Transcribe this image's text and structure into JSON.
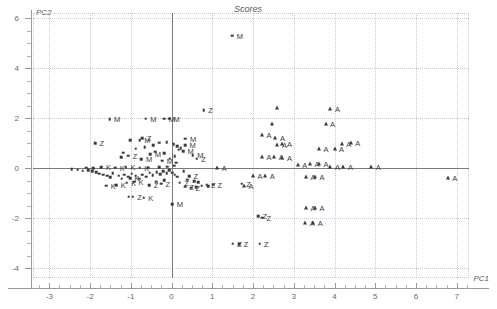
{
  "chart_data": {
    "type": "scatter",
    "title": "Scores",
    "xlabel": "PC1",
    "ylabel": "PC2",
    "xlim": [
      -3.4,
      7.3
    ],
    "ylim": [
      -4.4,
      6.2
    ],
    "xticks": [
      -3,
      -2,
      -1,
      0,
      1,
      2,
      3,
      4,
      5,
      6,
      7
    ],
    "xticklabels": [
      "-3",
      "-2",
      "-1",
      "0",
      "1",
      "2",
      "3",
      "4",
      "5",
      "6",
      "7"
    ],
    "yticks": [
      -4,
      -2,
      0,
      2,
      4,
      6
    ],
    "yticklabels": [
      "-4",
      "-2",
      "0",
      "2",
      "4",
      "6"
    ],
    "xminorstep": 0.25,
    "yminorstep": 0.5,
    "grid": "dotted",
    "grid_x": [
      -3,
      -2,
      -1,
      0,
      1,
      2,
      3,
      4,
      5,
      6,
      7
    ],
    "grid_y": [
      -4,
      -2,
      0,
      2,
      4,
      6
    ],
    "legend": "none",
    "marker_color": "#3a3a3a",
    "axis_color": "#9a9a9a",
    "grid_color": "#c8c8d8",
    "series": [
      {
        "name": "M",
        "marker": "square",
        "label": "M",
        "points": [
          {
            "x": 1.49,
            "y": 5.3,
            "label": "M"
          },
          {
            "x": -1.52,
            "y": 1.95,
            "label": "M"
          },
          {
            "x": -0.63,
            "y": 1.98,
            "label": "M"
          },
          {
            "x": -0.18,
            "y": 1.97,
            "label": "M"
          },
          {
            "x": -0.06,
            "y": 1.97,
            "label": "M"
          },
          {
            "x": -0.78,
            "y": 1.12,
            "label": "M"
          },
          {
            "x": 0.34,
            "y": 1.18,
            "label": "M"
          },
          {
            "x": 0.33,
            "y": 0.92,
            "label": "M"
          },
          {
            "x": 0.28,
            "y": 0.68,
            "label": "M"
          },
          {
            "x": 0.52,
            "y": 0.52,
            "label": "M"
          },
          {
            "x": -0.52,
            "y": 0.56,
            "label": "M"
          },
          {
            "x": -0.74,
            "y": 0.36,
            "label": "M"
          },
          {
            "x": -0.23,
            "y": 0.3,
            "label": "M"
          },
          {
            "x": 0.02,
            "y": -1.45,
            "label": "M"
          },
          {
            "x": -0.88,
            "y": 0.78,
            "label": ""
          },
          {
            "x": -0.66,
            "y": 0.84,
            "label": ""
          },
          {
            "x": -0.45,
            "y": 0.92,
            "label": ""
          },
          {
            "x": -0.3,
            "y": 1.02,
            "label": ""
          },
          {
            "x": -0.12,
            "y": 1.04,
            "label": ""
          },
          {
            "x": 0.05,
            "y": 0.96,
            "label": ""
          },
          {
            "x": 0.14,
            "y": 0.88,
            "label": ""
          },
          {
            "x": 0.18,
            "y": 0.74,
            "label": ""
          },
          {
            "x": -0.4,
            "y": 0.66,
            "label": ""
          },
          {
            "x": -0.18,
            "y": 0.6,
            "label": ""
          },
          {
            "x": 0.08,
            "y": 0.48,
            "label": ""
          },
          {
            "x": -0.05,
            "y": 0.38,
            "label": ""
          },
          {
            "x": -1.02,
            "y": 1.12,
            "label": ""
          },
          {
            "x": -1.18,
            "y": 0.62,
            "label": ""
          },
          {
            "x": -1.24,
            "y": 0.44,
            "label": ""
          }
        ]
      },
      {
        "name": "Z",
        "marker": "square",
        "label": "Z",
        "points": [
          {
            "x": 0.79,
            "y": 2.32,
            "label": "Z"
          },
          {
            "x": -1.88,
            "y": 1.0,
            "label": "Z"
          },
          {
            "x": -0.72,
            "y": 1.2,
            "label": "Z"
          },
          {
            "x": -1.06,
            "y": 0.5,
            "label": "Z"
          },
          {
            "x": 0.62,
            "y": 0.38,
            "label": "Z"
          },
          {
            "x": 0.43,
            "y": -0.32,
            "label": "Z"
          },
          {
            "x": 0.2,
            "y": -0.58,
            "label": "Z"
          },
          {
            "x": 0.33,
            "y": -0.74,
            "label": "Z"
          },
          {
            "x": 0.48,
            "y": -0.78,
            "label": "Z"
          },
          {
            "x": -0.26,
            "y": -0.62,
            "label": "Z"
          },
          {
            "x": -0.95,
            "y": -1.15,
            "label": "Z"
          },
          {
            "x": -0.55,
            "y": -0.68,
            "label": "Z"
          },
          {
            "x": 0.86,
            "y": -0.66,
            "label": "Z"
          },
          {
            "x": 1.02,
            "y": -0.66,
            "label": "Z"
          },
          {
            "x": 1.72,
            "y": -0.62,
            "label": "Z"
          },
          {
            "x": 2.12,
            "y": -1.92,
            "label": "Z"
          },
          {
            "x": 2.22,
            "y": -1.98,
            "label": "Z"
          },
          {
            "x": 1.5,
            "y": -3.02,
            "label": "Z"
          },
          {
            "x": 1.66,
            "y": -3.04,
            "label": "Z"
          },
          {
            "x": 2.16,
            "y": -3.02,
            "label": "Z"
          },
          {
            "x": 0.22,
            "y": 0.8,
            "label": ""
          },
          {
            "x": 0.3,
            "y": -0.12,
            "label": ""
          },
          {
            "x": 0.38,
            "y": -0.46,
            "label": ""
          },
          {
            "x": 0.55,
            "y": -0.52,
            "label": ""
          },
          {
            "x": 0.66,
            "y": -0.56,
            "label": ""
          },
          {
            "x": 0.74,
            "y": -0.7,
            "label": ""
          },
          {
            "x": 0.6,
            "y": -0.76,
            "label": ""
          },
          {
            "x": 0.9,
            "y": -0.72,
            "label": ""
          },
          {
            "x": -0.18,
            "y": -0.48,
            "label": ""
          },
          {
            "x": -0.38,
            "y": -0.54,
            "label": ""
          }
        ]
      },
      {
        "name": "K",
        "marker": "square",
        "label": "K",
        "points": [
          {
            "x": -1.72,
            "y": 0.04,
            "label": "K"
          },
          {
            "x": -1.38,
            "y": 0.02,
            "label": "K"
          },
          {
            "x": -1.12,
            "y": 0.03,
            "label": "K"
          },
          {
            "x": -0.78,
            "y": 0.02,
            "label": "K"
          },
          {
            "x": -1.6,
            "y": -0.7,
            "label": "K"
          },
          {
            "x": -1.36,
            "y": -0.68,
            "label": "K"
          },
          {
            "x": -1.1,
            "y": -0.58,
            "label": "K"
          },
          {
            "x": -1.02,
            "y": -0.4,
            "label": "K"
          },
          {
            "x": -0.92,
            "y": -0.54,
            "label": "K"
          },
          {
            "x": -0.68,
            "y": -1.18,
            "label": "K"
          },
          {
            "x": -2.45,
            "y": -0.04,
            "label": ""
          },
          {
            "x": -2.3,
            "y": -0.06,
            "label": ""
          },
          {
            "x": -2.18,
            "y": -0.1,
            "label": ""
          },
          {
            "x": -2.05,
            "y": -0.08,
            "label": ""
          },
          {
            "x": -1.95,
            "y": -0.12,
            "label": ""
          },
          {
            "x": -1.85,
            "y": -0.16,
            "label": ""
          },
          {
            "x": -1.78,
            "y": -0.22,
            "label": ""
          },
          {
            "x": -1.68,
            "y": -0.26,
            "label": ""
          },
          {
            "x": -1.58,
            "y": -0.3,
            "label": ""
          },
          {
            "x": -1.5,
            "y": -0.36,
            "label": ""
          },
          {
            "x": -1.44,
            "y": -0.2,
            "label": ""
          },
          {
            "x": -1.3,
            "y": -0.3,
            "label": ""
          },
          {
            "x": -1.22,
            "y": -0.42,
            "label": ""
          },
          {
            "x": -1.16,
            "y": -0.26,
            "label": ""
          },
          {
            "x": -1.06,
            "y": -0.34,
            "label": ""
          },
          {
            "x": -0.98,
            "y": -0.22,
            "label": ""
          },
          {
            "x": -0.88,
            "y": -0.3,
            "label": ""
          },
          {
            "x": -0.8,
            "y": -0.42,
            "label": ""
          },
          {
            "x": -0.72,
            "y": -0.26,
            "label": ""
          },
          {
            "x": -0.62,
            "y": -0.34,
            "label": ""
          },
          {
            "x": -0.54,
            "y": -0.18,
            "label": ""
          },
          {
            "x": -0.46,
            "y": -0.28,
            "label": ""
          },
          {
            "x": -0.36,
            "y": -0.16,
            "label": ""
          },
          {
            "x": -0.28,
            "y": -0.24,
            "label": ""
          },
          {
            "x": -0.2,
            "y": -0.12,
            "label": ""
          },
          {
            "x": -0.12,
            "y": -0.2,
            "label": ""
          },
          {
            "x": -0.06,
            "y": -0.08,
            "label": ""
          },
          {
            "x": 0.02,
            "y": -0.18,
            "label": ""
          },
          {
            "x": 0.08,
            "y": -0.26,
            "label": ""
          },
          {
            "x": 0.14,
            "y": -0.34,
            "label": ""
          },
          {
            "x": -1.05,
            "y": -1.15,
            "label": ""
          },
          {
            "x": -0.58,
            "y": 0.02,
            "label": ""
          },
          {
            "x": -0.3,
            "y": 0.04,
            "label": ""
          },
          {
            "x": -0.1,
            "y": 0.05,
            "label": ""
          },
          {
            "x": 0.06,
            "y": 0.1,
            "label": ""
          },
          {
            "x": 0.12,
            "y": 0.22,
            "label": ""
          },
          {
            "x": -1.92,
            "y": 0.0,
            "label": ""
          },
          {
            "x": -2.1,
            "y": 0.02,
            "label": ""
          }
        ]
      },
      {
        "name": "A",
        "marker": "triangle",
        "label": "A",
        "points": [
          {
            "x": 3.9,
            "y": 2.38,
            "label": "A"
          },
          {
            "x": 3.78,
            "y": 1.75,
            "label": "A"
          },
          {
            "x": 2.22,
            "y": 1.32,
            "label": "A"
          },
          {
            "x": 2.55,
            "y": 1.2,
            "label": "A"
          },
          {
            "x": 2.6,
            "y": 0.92,
            "label": "A"
          },
          {
            "x": 2.72,
            "y": 0.98,
            "label": "A"
          },
          {
            "x": 4.18,
            "y": 0.98,
            "label": "A"
          },
          {
            "x": 4.4,
            "y": 1.0,
            "label": "A"
          },
          {
            "x": 3.62,
            "y": 0.78,
            "label": "A"
          },
          {
            "x": 4.0,
            "y": 0.78,
            "label": "A"
          },
          {
            "x": 2.22,
            "y": 0.44,
            "label": "A"
          },
          {
            "x": 2.52,
            "y": 0.44,
            "label": "A"
          },
          {
            "x": 2.72,
            "y": 0.42,
            "label": "A"
          },
          {
            "x": 3.1,
            "y": 0.14,
            "label": "A"
          },
          {
            "x": 3.4,
            "y": 0.18,
            "label": "A"
          },
          {
            "x": 3.62,
            "y": 0.16,
            "label": "A"
          },
          {
            "x": 3.9,
            "y": 0.04,
            "label": "A"
          },
          {
            "x": 4.22,
            "y": 0.04,
            "label": "A"
          },
          {
            "x": 4.9,
            "y": 0.04,
            "label": "A"
          },
          {
            "x": 6.78,
            "y": -0.38,
            "label": "A"
          },
          {
            "x": 1.12,
            "y": 0.02,
            "label": "A"
          },
          {
            "x": 2.0,
            "y": -0.3,
            "label": "A"
          },
          {
            "x": 2.3,
            "y": -0.32,
            "label": "A"
          },
          {
            "x": 3.3,
            "y": -0.36,
            "label": "A"
          },
          {
            "x": 3.52,
            "y": -0.34,
            "label": "A"
          },
          {
            "x": 1.78,
            "y": -0.7,
            "label": "A"
          },
          {
            "x": 3.3,
            "y": -1.58,
            "label": "A"
          },
          {
            "x": 3.52,
            "y": -1.6,
            "label": "A"
          },
          {
            "x": 3.28,
            "y": -2.18,
            "label": "A"
          },
          {
            "x": 3.48,
            "y": -2.18,
            "label": "A"
          },
          {
            "x": 2.6,
            "y": 2.4,
            "label": ""
          },
          {
            "x": 2.46,
            "y": 1.78,
            "label": ""
          }
        ]
      }
    ]
  }
}
